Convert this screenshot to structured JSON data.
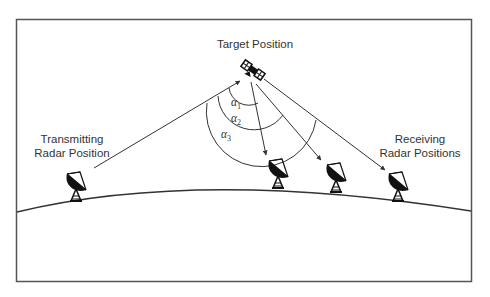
{
  "diagram": {
    "frame": {
      "x": 16,
      "y": 19,
      "w": 455,
      "h": 262,
      "stroke": "#555555"
    },
    "labels": {
      "target": "Target Position",
      "transmitter_line1": "Transmitting",
      "transmitter_line2": "Radar Position",
      "receiver_line1": "Receiving",
      "receiver_line2": "Radar Positions"
    },
    "angles": [
      {
        "symbol": "α",
        "sub": "1"
      },
      {
        "symbol": "α",
        "sub": "2"
      },
      {
        "symbol": "α",
        "sub": "3"
      }
    ],
    "nodes": {
      "target": {
        "x": 253,
        "y": 70,
        "icon": "satellite-icon"
      },
      "transmitter": {
        "x": 78,
        "y": 186,
        "icon": "radar-dish-icon"
      },
      "receivers": [
        {
          "x": 280,
          "y": 175,
          "icon": "radar-dish-icon"
        },
        {
          "x": 336,
          "y": 180,
          "icon": "radar-dish-icon"
        },
        {
          "x": 398,
          "y": 187,
          "icon": "radar-dish-icon"
        }
      ]
    },
    "colors": {
      "line": "#333333",
      "text": "#333333",
      "icon": "#111111"
    }
  }
}
